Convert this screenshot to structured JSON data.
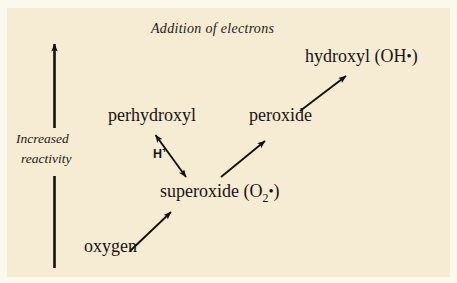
{
  "figure": {
    "background_color": "#f6ecd4",
    "ink_color": "#1a1410",
    "title": "Addition of  electrons"
  },
  "axis": {
    "name": "increased-reactivity-axis",
    "label_line1": "Increased",
    "label_line2": "reactivity",
    "direction": "upward"
  },
  "species": [
    {
      "id": "oxygen",
      "label": "oxygen"
    },
    {
      "id": "superoxide",
      "label_prefix": "superoxide (O",
      "subscript": "2",
      "radical": "•",
      "label_suffix": ")"
    },
    {
      "id": "perhydroxyl",
      "label": "perhydroxyl"
    },
    {
      "id": "peroxide",
      "label": "peroxide"
    },
    {
      "id": "hydroxyl",
      "label_prefix": "hydroxyl (OH",
      "radical": "•",
      "label_suffix": ")"
    }
  ],
  "annotations": {
    "proton": "H",
    "proton_charge": "+"
  },
  "arrows": [
    {
      "id": "oxygen-to-superoxide",
      "from": "oxygen",
      "to": "superoxide",
      "heads": 1
    },
    {
      "id": "superoxide-to-perhydroxyl",
      "from": "superoxide",
      "to": "perhydroxyl",
      "heads": 2,
      "label": "H+"
    },
    {
      "id": "superoxide-to-peroxide",
      "from": "superoxide",
      "to": "peroxide",
      "heads": 1
    },
    {
      "id": "peroxide-to-hydroxyl",
      "from": "peroxide",
      "to": "hydroxyl",
      "heads": 1
    },
    {
      "id": "reactivity-axis-arrow",
      "from": "bottom",
      "to": "top",
      "heads": 1
    }
  ]
}
